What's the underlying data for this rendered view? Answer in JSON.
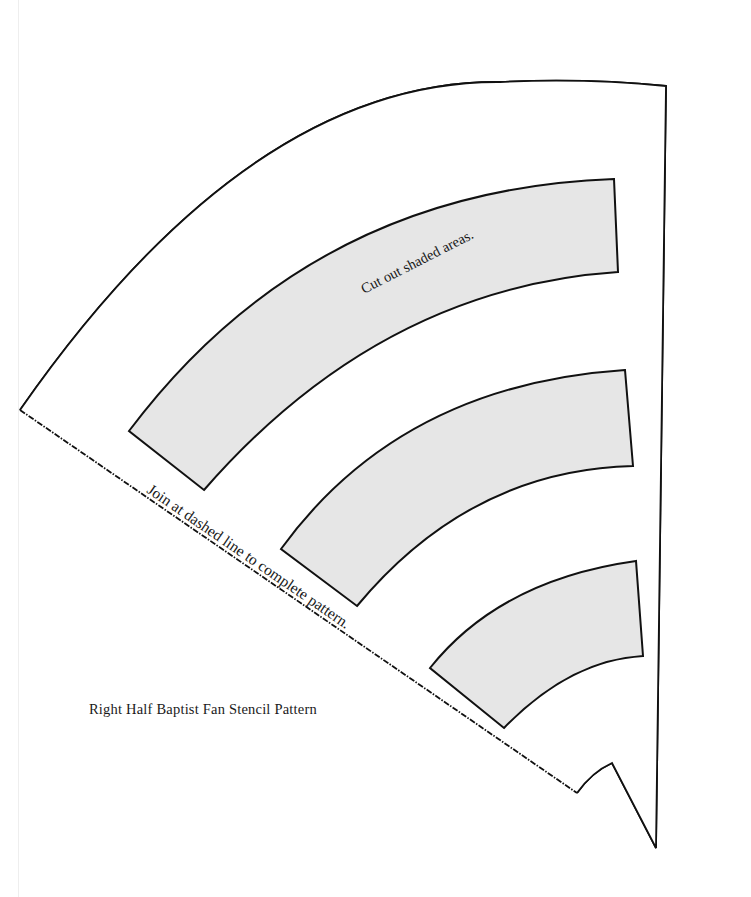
{
  "pattern": {
    "title": "Right Half Baptist Fan Stencil Pattern",
    "shaded_instruction": "Cut out shaded areas.",
    "join_instruction": "Join at dashed line to complete pattern.",
    "colors": {
      "outline": "#111111",
      "shaded_fill": "#e6e6e6",
      "background": "#ffffff"
    },
    "bands": [
      {
        "name": "outer-band"
      },
      {
        "name": "middle-band"
      },
      {
        "name": "inner-band"
      }
    ]
  }
}
